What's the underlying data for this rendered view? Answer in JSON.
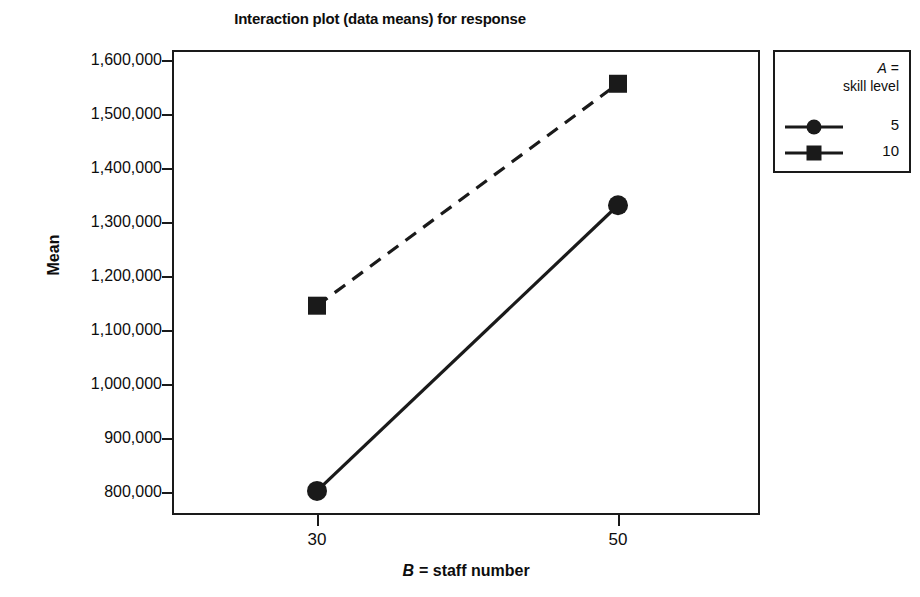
{
  "chart_data": {
    "type": "line",
    "title": "Interaction plot (data means) for response",
    "xlabel": "B = staff number",
    "ylabel": "Mean",
    "categories": [
      "30",
      "50"
    ],
    "x": [
      30,
      50
    ],
    "xlim": [
      20,
      60
    ],
    "ylim": [
      760000,
      1640000
    ],
    "ytick_labels": [
      "1,600,000",
      "1,500,000",
      "1,400,000",
      "1,300,000",
      "1,200,000",
      "1,100,000",
      "1,000,000",
      "900,000",
      "800,000"
    ],
    "ytick_values": [
      1600000,
      1500000,
      1400000,
      1300000,
      1200000,
      1100000,
      1000000,
      900000,
      800000
    ],
    "xtick_labels": [
      "30",
      "50"
    ],
    "grid": false,
    "legend_position": "right-outside",
    "legend_title_line1": "A =",
    "legend_title_line2": "skill level",
    "legend_title_var": "A",
    "xlabel_var": "B",
    "xlabel_rest": "= staff number",
    "series": [
      {
        "name": "5",
        "marker": "circle",
        "linestyle": "solid",
        "color": "#1a1a1a",
        "values": [
          802000,
          1331000
        ]
      },
      {
        "name": "10",
        "marker": "square",
        "linestyle": "dashed",
        "color": "#1a1a1a",
        "values": [
          1145000,
          1556000
        ]
      }
    ]
  }
}
